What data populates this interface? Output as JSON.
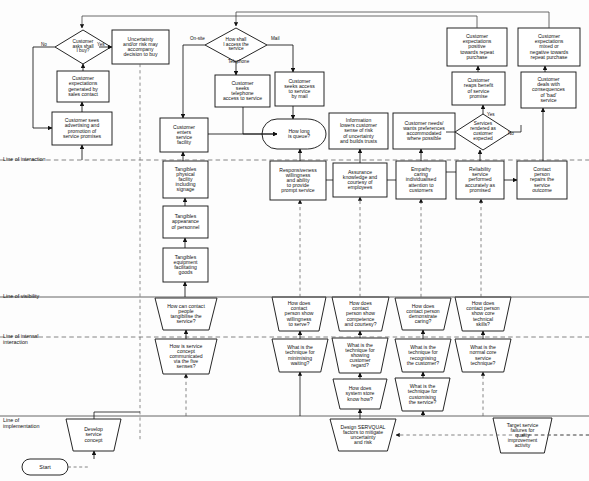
{
  "diagram": {
    "type": "service-blueprint-flowchart",
    "canvas": {
      "width": 589,
      "height": 481
    },
    "colors": {
      "stroke": "#1a1a1a",
      "fill": "#ffffff",
      "band_line": "#555555",
      "dashed_line": "#666666",
      "background": "#fdfdfd"
    }
  },
  "bands": [
    {
      "id": "line-of-interaction",
      "label": "Line of interaction",
      "y": 160,
      "style": "dashed",
      "label_x": 3,
      "label_y": 156
    },
    {
      "id": "line-of-visibility",
      "label": "Line of visibility",
      "y": 297,
      "style": "solid",
      "label_x": 3,
      "label_y": 293
    },
    {
      "id": "line-of-internal-interaction",
      "label": "Line of internal\ninteraction",
      "y": 337,
      "style": "dashed",
      "label_x": 3,
      "label_y": 333
    },
    {
      "id": "line-of-implementation",
      "label": "Line of\nimplementation",
      "y": 416,
      "style": "solid",
      "label_x": 3,
      "label_y": 417
    }
  ],
  "edge_labels": [
    {
      "id": "label-no-buy",
      "text": "No",
      "x": 41,
      "y": 42
    },
    {
      "id": "label-yes-buy",
      "text": "Yes",
      "x": 97,
      "y": 42
    },
    {
      "id": "label-onsite",
      "text": "On-site",
      "x": 190,
      "y": 36
    },
    {
      "id": "label-mail",
      "text": "Mail",
      "x": 271,
      "y": 36
    },
    {
      "id": "label-telephone",
      "text": "Telephone",
      "x": 228,
      "y": 59
    },
    {
      "id": "label-yes-rendered",
      "text": "Yes",
      "x": 487,
      "y": 112
    },
    {
      "id": "label-no-rendered",
      "text": "No",
      "x": 508,
      "y": 131
    }
  ],
  "nodes": [
    {
      "id": "customer-asks-shall-i-buy",
      "shape": "diamond",
      "label": "Customer\nasks shall\nI buy?",
      "x": 55,
      "y": 30,
      "w": 56,
      "h": 34
    },
    {
      "id": "uncertainty-risk-accompany",
      "shape": "rect",
      "label": "Uncertainty\nand/or risk may\naccompany\ndecision to buy",
      "x": 112,
      "y": 30,
      "w": 57,
      "h": 34
    },
    {
      "id": "customer-expectations-sales-contact",
      "shape": "rect",
      "label": "Customer\nexpectations\ngenerated by\nsales contact",
      "x": 57,
      "y": 71,
      "w": 52,
      "h": 31
    },
    {
      "id": "customer-sees-advertising",
      "shape": "rect",
      "label": "Customer sees\nadvertising and\npromotion of\nservice promises",
      "x": 52,
      "y": 112,
      "w": 60,
      "h": 33
    },
    {
      "id": "how-shall-i-access-service",
      "shape": "diamond",
      "label": "How shall\nI access the\nservice",
      "x": 205,
      "y": 28,
      "w": 62,
      "h": 34
    },
    {
      "id": "customer-seeks-telephone-access",
      "shape": "rect",
      "label": "Customer\nseeks\ntelephone\naccess to service",
      "x": 215,
      "y": 75,
      "w": 55,
      "h": 32
    },
    {
      "id": "customer-seeks-access-by-mail",
      "shape": "rect",
      "label": "Customer\nseeks access\nto service\nby mail",
      "x": 275,
      "y": 72,
      "w": 49,
      "h": 34
    },
    {
      "id": "customer-enters-service-facility",
      "shape": "rect",
      "label": "Customer\nenters\nservice\nfacility",
      "x": 160,
      "y": 118,
      "w": 48,
      "h": 34
    },
    {
      "id": "how-long-is-queue",
      "shape": "oval-flag",
      "label": "How long\nis queue?",
      "x": 277,
      "y": 119,
      "w": 49,
      "h": 30
    },
    {
      "id": "information-lowers-risk",
      "shape": "rect",
      "label": "Information\nlowers customer\nsense of risk\nof uncertainty\nand builds trusts",
      "x": 329,
      "y": 113,
      "w": 59,
      "h": 36
    },
    {
      "id": "customer-needs-accommodated",
      "shape": "rect",
      "label": "Customer needs/\nwants preferences\naccommodated\nwhere possible",
      "x": 393,
      "y": 113,
      "w": 62,
      "h": 36
    },
    {
      "id": "services-rendered-as-expected",
      "shape": "diamond",
      "label": "Services\nrendered as\ncustomer\nexpected",
      "x": 455,
      "y": 114,
      "w": 56,
      "h": 36
    },
    {
      "id": "customer-reaps-benefit",
      "shape": "rect",
      "label": "Customer\nreaps benefit\nof service\npromise",
      "x": 452,
      "y": 72,
      "w": 53,
      "h": 33
    },
    {
      "id": "customer-expectations-positive",
      "shape": "rect",
      "label": "Customer\nexpectations\npositive\ntowards repeat\npurchase",
      "x": 447,
      "y": 28,
      "w": 60,
      "h": 38
    },
    {
      "id": "customer-deals-with-consequences",
      "shape": "rect",
      "label": "Customer\ndeals with\nconsequences\nof 'bad'\nservice",
      "x": 521,
      "y": 72,
      "w": 55,
      "h": 36
    },
    {
      "id": "customer-expectations-mixed",
      "shape": "rect",
      "label": "Customer\nexpectations\nmixed or\nnegative towards\nrepeat purchase",
      "x": 518,
      "y": 28,
      "w": 62,
      "h": 38
    },
    {
      "id": "tangibles-physical-facility",
      "shape": "rect",
      "label": "Tangibles\nphysical\nfacility\nincluding\nsignage",
      "x": 163,
      "y": 161,
      "w": 45,
      "h": 37
    },
    {
      "id": "tangibles-appearance-personnel",
      "shape": "rect",
      "label": "Tangibles\nappearance\nof personnel",
      "x": 163,
      "y": 206,
      "w": 45,
      "h": 32
    },
    {
      "id": "tangibles-equipment-goods",
      "shape": "rect",
      "label": "Tangibles\nequipment\nfacilitating\ngoods",
      "x": 163,
      "y": 248,
      "w": 45,
      "h": 34
    },
    {
      "id": "responsiveness",
      "shape": "rect",
      "label": "Responsiveness\nwillingness\nand ability\nto provide\nprompt service",
      "x": 270,
      "y": 161,
      "w": 56,
      "h": 39
    },
    {
      "id": "assurance",
      "shape": "rect",
      "label": "Assurance\nknowledge and\ncourtesy of\nemployees",
      "x": 333,
      "y": 163,
      "w": 54,
      "h": 34
    },
    {
      "id": "empathy",
      "shape": "rect",
      "label": "Empathy\ncaring\nindividualised\nattention to\ncustomers",
      "x": 396,
      "y": 161,
      "w": 50,
      "h": 38
    },
    {
      "id": "reliability",
      "shape": "rect",
      "label": "Reliability\nservice\nperformed\naccurately as\npromised",
      "x": 456,
      "y": 161,
      "w": 48,
      "h": 38
    },
    {
      "id": "contact-person-repairs",
      "shape": "rect",
      "label": "Contact\nperson\nrepairs the\nservice\noutcome",
      "x": 517,
      "y": 161,
      "w": 50,
      "h": 38
    },
    {
      "id": "how-can-contact-tangibilise",
      "shape": "trapezoid",
      "label": "How can contact\npeople\ntangibilise the\nservice?",
      "x": 155,
      "y": 298,
      "w": 62,
      "h": 32
    },
    {
      "id": "how-does-show-willingness",
      "shape": "trapezoid",
      "label": "How does\ncontact\nperson show\nwillingness\nto serve?",
      "x": 272,
      "y": 297,
      "w": 54,
      "h": 34
    },
    {
      "id": "how-does-show-competence",
      "shape": "trapezoid",
      "label": "How does\ncontact\nperson show\ncompetence\nand courtesy?",
      "x": 332,
      "y": 297,
      "w": 57,
      "h": 34
    },
    {
      "id": "how-does-demonstrate-caring",
      "shape": "trapezoid",
      "label": "How does\ncontact person\ndemonstrate\ncaring?",
      "x": 395,
      "y": 298,
      "w": 56,
      "h": 32
    },
    {
      "id": "how-does-show-technical-skills",
      "shape": "trapezoid",
      "label": "How does\ncontact person\nshow core\ntechnical\nskills?",
      "x": 455,
      "y": 297,
      "w": 56,
      "h": 34
    },
    {
      "id": "how-is-service-concept-communicated",
      "shape": "trapezoid",
      "label": "How is service\nconcept\ncommunicated\nvia the five\nsenses?",
      "x": 155,
      "y": 339,
      "w": 62,
      "h": 35
    },
    {
      "id": "technique-minimising-waiting",
      "shape": "trapezoid",
      "label": "What is the\ntechnique for\nminimising\nwaiting?",
      "x": 272,
      "y": 339,
      "w": 56,
      "h": 33
    },
    {
      "id": "technique-showing-customer-regard",
      "shape": "trapezoid",
      "label": "What is the\ntechnique for\nshowing\ncustomer\nregard?",
      "x": 332,
      "y": 338,
      "w": 56,
      "h": 35
    },
    {
      "id": "technique-recognising-customer",
      "shape": "trapezoid",
      "label": "What is the\ntechnique for\nrecognising\nthe customer?",
      "x": 395,
      "y": 339,
      "w": 56,
      "h": 33
    },
    {
      "id": "normal-core-service-technique",
      "shape": "trapezoid",
      "label": "What is the\nnormal core\nservice\ntechnique?",
      "x": 455,
      "y": 339,
      "w": 56,
      "h": 33
    },
    {
      "id": "how-does-system-store-know-how",
      "shape": "trapezoid",
      "label": "How does\nsystem store\nknow how?",
      "x": 333,
      "y": 379,
      "w": 54,
      "h": 30
    },
    {
      "id": "technique-customising-service",
      "shape": "trapezoid",
      "label": "What is the\ntechnique for\ncustomising\nthe service?",
      "x": 395,
      "y": 378,
      "w": 55,
      "h": 33
    },
    {
      "id": "develop-service-concept",
      "shape": "trapezoid",
      "label": "Develop\nservice\nconcept",
      "x": 66,
      "y": 419,
      "w": 55,
      "h": 32
    },
    {
      "id": "design-servqual-factors",
      "shape": "trapezoid",
      "label": "Design SERVQUAL\nfactors to mitigate\nuncertainty\nand risk",
      "x": 330,
      "y": 419,
      "w": 66,
      "h": 32
    },
    {
      "id": "target-service-failures",
      "shape": "trapezoid",
      "label": "Target service\nfailures for\nquality\nimprovement\nactivity",
      "x": 493,
      "y": 418,
      "w": 59,
      "h": 35
    },
    {
      "id": "start",
      "shape": "stadium",
      "label": "Start",
      "x": 22,
      "y": 459,
      "w": 46,
      "h": 16
    }
  ]
}
